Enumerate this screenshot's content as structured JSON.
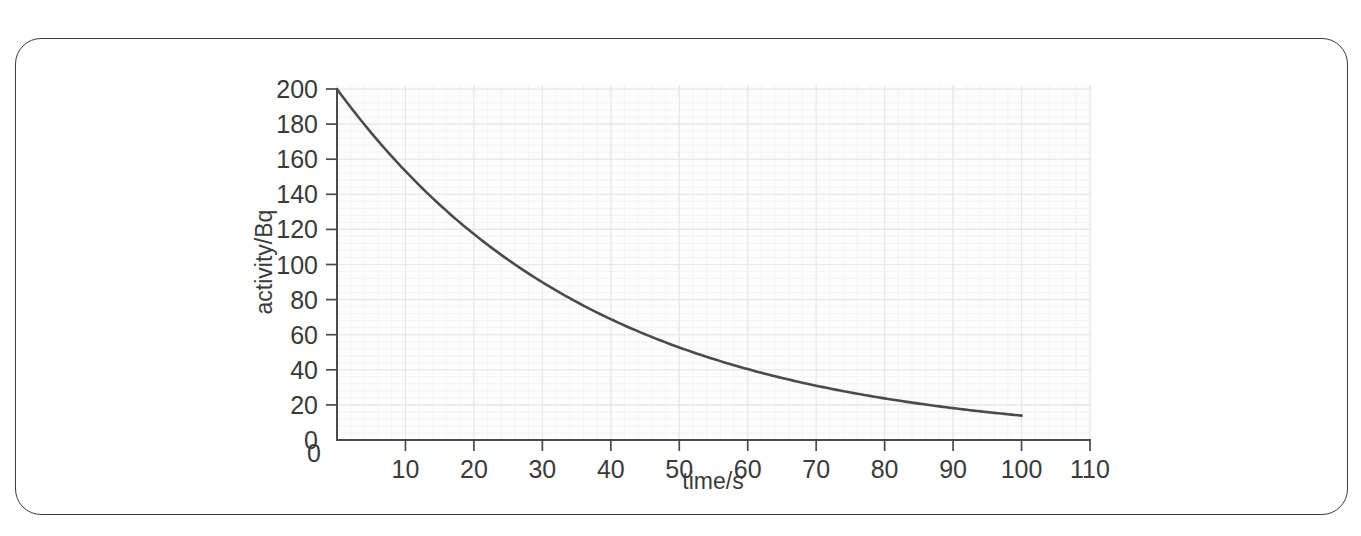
{
  "figure": {
    "frame_present": true,
    "border_color": "#3c3c3c",
    "background_color": "#ffffff"
  },
  "chart_data": {
    "type": "line",
    "title": "",
    "subtitle": "",
    "xlabel": "time/s",
    "ylabel": "activity/Bq",
    "xlim": [
      0,
      110
    ],
    "ylim": [
      0,
      200
    ],
    "xticks": [
      0,
      10,
      20,
      30,
      40,
      50,
      60,
      70,
      80,
      90,
      100,
      110
    ],
    "xtick_labels": [
      "0",
      "10",
      "20",
      "30",
      "40",
      "50",
      "60",
      "70",
      "80",
      "90",
      "100",
      "110"
    ],
    "yticks": [
      0,
      20,
      40,
      60,
      80,
      100,
      120,
      140,
      160,
      180,
      200
    ],
    "ytick_labels": [
      "0",
      "20",
      "40",
      "60",
      "80",
      "100",
      "120",
      "140",
      "160",
      "180",
      "200"
    ],
    "grid": "minor-and-major-faint",
    "legend": null,
    "legend_position": "none",
    "annotations": [],
    "curve_color": "#4b4b4b",
    "series": [
      {
        "name": "activity",
        "model": "exponential decay",
        "initial_activity": 200,
        "half_life_s": 26,
        "decay_constant_per_s": 0.02666,
        "x": [
          0,
          5,
          10,
          15,
          20,
          25,
          30,
          35,
          40,
          45,
          50,
          55,
          60,
          65,
          70,
          75,
          80,
          85,
          90,
          95,
          100
        ],
        "values": [
          200,
          175,
          153,
          134,
          117,
          103,
          90,
          79,
          69,
          60,
          53,
          46,
          40,
          35,
          31,
          27,
          24,
          21,
          18,
          16,
          14
        ]
      }
    ]
  }
}
